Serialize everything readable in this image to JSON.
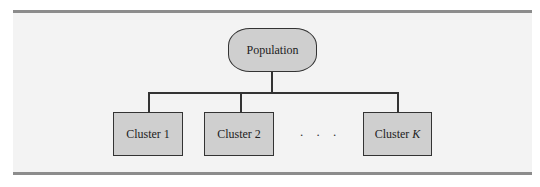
{
  "diagram": {
    "root": {
      "label": "Population"
    },
    "children": [
      {
        "label": "Cluster 1",
        "italic_suffix": ""
      },
      {
        "label": "Cluster 2",
        "italic_suffix": ""
      },
      {
        "label": "Cluster ",
        "italic_suffix": "K"
      }
    ],
    "ellipsis": ". . .",
    "colors": {
      "box_fill": "#cfcfcf",
      "border": "#333333",
      "background": "#f3f3f3",
      "rule": "#8c8c8c"
    }
  }
}
